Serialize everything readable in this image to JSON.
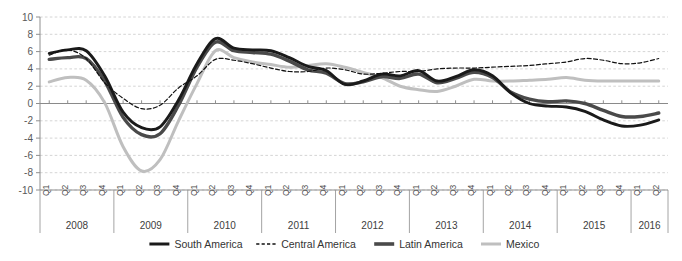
{
  "chart_data": {
    "type": "line",
    "title": "",
    "xlabel": "",
    "ylabel": "",
    "ylim": [
      -10,
      10
    ],
    "yticks": [
      10,
      8,
      6,
      4,
      2,
      0,
      -2,
      -4,
      -6,
      -8,
      -10
    ],
    "ytick_labels": [
      "10",
      "8",
      "6",
      "4",
      "2",
      "0",
      "-2",
      "-4",
      "-6",
      "-8",
      "-10"
    ],
    "grid": true,
    "legend_position": "bottom",
    "quarter_labels": [
      "Q1",
      "Q2",
      "Q3",
      "Q4"
    ],
    "years": [
      {
        "year": "2008",
        "quarters": [
          "Q1",
          "Q2",
          "Q3",
          "Q4"
        ]
      },
      {
        "year": "2009",
        "quarters": [
          "Q1",
          "Q2",
          "Q3",
          "Q4"
        ]
      },
      {
        "year": "2010",
        "quarters": [
          "Q1",
          "Q2",
          "Q3",
          "Q4"
        ]
      },
      {
        "year": "2011",
        "quarters": [
          "Q1",
          "Q2",
          "Q3",
          "Q4"
        ]
      },
      {
        "year": "2012",
        "quarters": [
          "Q1",
          "Q2",
          "Q3",
          "Q4"
        ]
      },
      {
        "year": "2013",
        "quarters": [
          "Q1",
          "Q2",
          "Q3",
          "Q4"
        ]
      },
      {
        "year": "2014",
        "quarters": [
          "Q1",
          "Q2",
          "Q3",
          "Q4"
        ]
      },
      {
        "year": "2015",
        "quarters": [
          "Q1",
          "Q2",
          "Q3",
          "Q4"
        ]
      },
      {
        "year": "2016",
        "quarters": [
          "Q1",
          "Q2"
        ]
      }
    ],
    "x": [
      "2008Q1",
      "2008Q2",
      "2008Q3",
      "2008Q4",
      "2009Q1",
      "2009Q2",
      "2009Q3",
      "2009Q4",
      "2010Q1",
      "2010Q2",
      "2010Q3",
      "2010Q4",
      "2011Q1",
      "2011Q2",
      "2011Q3",
      "2011Q4",
      "2012Q1",
      "2012Q2",
      "2012Q3",
      "2012Q4",
      "2013Q1",
      "2013Q2",
      "2013Q3",
      "2013Q4",
      "2014Q1",
      "2014Q2",
      "2014Q3",
      "2014Q4",
      "2015Q1",
      "2015Q2",
      "2015Q3",
      "2015Q4",
      "2016Q1",
      "2016Q2"
    ],
    "series": [
      {
        "name": "South America",
        "color": "#1a1a1a",
        "width": 2.9,
        "dash": "none",
        "values": [
          5.8,
          6.2,
          6.1,
          3.2,
          -1.0,
          -2.8,
          -2.7,
          0.4,
          4.6,
          7.5,
          6.4,
          6.2,
          6.1,
          5.3,
          4.3,
          3.8,
          2.2,
          2.6,
          3.4,
          3.2,
          3.8,
          2.6,
          3.1,
          3.9,
          3.2,
          1.2,
          0.0,
          -0.3,
          -0.4,
          -0.9,
          -1.9,
          -2.6,
          -2.5,
          -1.9
        ]
      },
      {
        "name": "Central America",
        "color": "#111111",
        "width": 1.2,
        "dash": "4 2.4",
        "values": [
          5.6,
          6.2,
          5.2,
          2.4,
          0.6,
          -0.6,
          -0.2,
          1.8,
          3.2,
          5.1,
          5.0,
          4.6,
          4.1,
          3.7,
          3.7,
          4.1,
          3.9,
          3.4,
          3.5,
          3.7,
          3.7,
          4.0,
          4.1,
          4.1,
          4.2,
          4.3,
          4.4,
          4.6,
          4.8,
          5.2,
          5.0,
          4.6,
          4.7,
          5.2
        ]
      },
      {
        "name": "Latin America",
        "color": "#4a4a4a",
        "width": 3.4,
        "dash": "none",
        "values": [
          5.1,
          5.3,
          5.2,
          2.6,
          -1.6,
          -3.6,
          -3.5,
          -0.2,
          4.2,
          7.1,
          6.1,
          5.9,
          5.7,
          4.9,
          3.9,
          3.5,
          2.3,
          2.5,
          3.1,
          2.9,
          3.4,
          2.4,
          2.9,
          3.6,
          3.0,
          1.3,
          0.5,
          0.2,
          0.3,
          0.0,
          -0.8,
          -1.5,
          -1.5,
          -1.1
        ]
      },
      {
        "name": "Mexico",
        "color": "#bfbfbf",
        "width": 3.0,
        "dash": "none",
        "values": [
          2.5,
          3.0,
          2.7,
          0.1,
          -5.0,
          -7.8,
          -6.5,
          -2.0,
          2.3,
          6.1,
          5.3,
          4.8,
          4.5,
          4.2,
          4.4,
          4.6,
          4.2,
          3.6,
          3.0,
          2.0,
          1.6,
          1.4,
          2.0,
          2.8,
          2.6,
          2.6,
          2.7,
          2.8,
          3.0,
          2.7,
          2.6,
          2.6,
          2.6,
          2.6
        ]
      }
    ],
    "legend": [
      {
        "label": "South America",
        "color": "#1a1a1a",
        "dash": "none",
        "width": 3.0
      },
      {
        "label": "Central America",
        "color": "#111111",
        "dash": "3.2 2.2",
        "width": 1.3
      },
      {
        "label": "Latin America",
        "color": "#4a4a4a",
        "dash": "none",
        "width": 3.6
      },
      {
        "label": "Mexico",
        "color": "#bfbfbf",
        "dash": "none",
        "width": 3.0
      }
    ]
  }
}
